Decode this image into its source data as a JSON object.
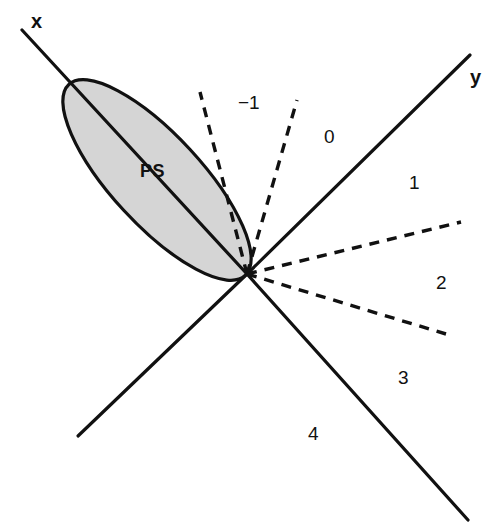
{
  "figure": {
    "width": 492,
    "height": 531,
    "background_color": "#ffffff",
    "line_color": "#111111",
    "ellipse_fill_color": "#d5d5d5",
    "ellipse_stroke_color": "#111111"
  },
  "vertex": {
    "x": 247,
    "y": 274
  },
  "axes": [
    {
      "name": "x-axis",
      "label": "x",
      "label_x": 31,
      "label_y": 10,
      "x1": 22,
      "y1": 30,
      "x2": 247,
      "y2": 274,
      "style": "solid"
    },
    {
      "name": "y-axis",
      "label": "y",
      "label_x": 470,
      "label_y": 66,
      "x1": 247,
      "y1": 274,
      "x2": 470,
      "y2": 55,
      "style": "solid"
    },
    {
      "name": "lower-left-axis",
      "label": "",
      "x1": 247,
      "y1": 274,
      "x2": 78,
      "y2": 436,
      "style": "solid"
    },
    {
      "name": "lower-right-axis",
      "label": "",
      "x1": 247,
      "y1": 274,
      "x2": 468,
      "y2": 520,
      "style": "solid"
    }
  ],
  "dashed_lines": [
    {
      "name": "dashed-ray-1",
      "x1": 247,
      "y1": 274,
      "x2": 200,
      "y2": 92
    },
    {
      "name": "dashed-ray-2",
      "x1": 247,
      "y1": 274,
      "x2": 297,
      "y2": 100
    },
    {
      "name": "dashed-ray-3",
      "x1": 247,
      "y1": 274,
      "x2": 461,
      "y2": 222
    },
    {
      "name": "dashed-ray-4",
      "x1": 247,
      "y1": 274,
      "x2": 446,
      "y2": 334
    }
  ],
  "ellipse": {
    "name": "PS",
    "label": "PS",
    "label_x": 140,
    "label_y": 161,
    "center_x": 157,
    "center_y": 180,
    "radius_major": 130,
    "radius_minor": 45,
    "rotation_deg": 47.3
  },
  "region_labels": [
    {
      "name": "region-minus-1",
      "text": "−1",
      "x": 238,
      "y": 92
    },
    {
      "name": "region-0",
      "text": "0",
      "x": 324,
      "y": 126
    },
    {
      "name": "region-1",
      "text": "1",
      "x": 409,
      "y": 172
    },
    {
      "name": "region-2",
      "text": "2",
      "x": 436,
      "y": 272
    },
    {
      "name": "region-3",
      "text": "3",
      "x": 398,
      "y": 367
    },
    {
      "name": "region-4",
      "text": "4",
      "x": 308,
      "y": 423
    }
  ]
}
